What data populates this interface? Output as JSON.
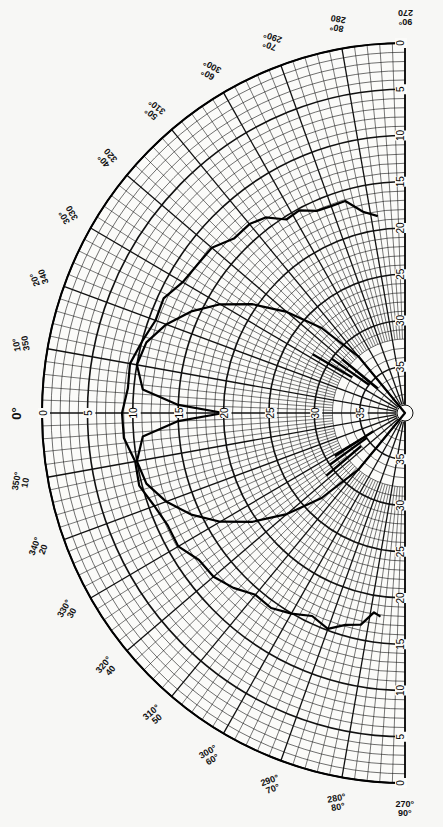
{
  "chart_data": {
    "type": "polar-line",
    "title": "",
    "center_px": [
      405,
      413
    ],
    "radius_px": 368,
    "radial_axis": {
      "label": "dB down",
      "min": 0,
      "max": 40,
      "outer_value": 0,
      "center_value": 40,
      "ticks": [
        0,
        5,
        10,
        15,
        20,
        25,
        30,
        35
      ],
      "tick_labels_upper": [
        "0",
        "5",
        "10",
        "15",
        "20",
        "25",
        "30",
        "35"
      ],
      "tick_labels_lower": [
        "0",
        "5",
        "10",
        "15",
        "20",
        "25",
        "30",
        "35"
      ],
      "tick_labels_axis0": [
        "0",
        "5",
        "10",
        "15",
        "20",
        "25",
        "30",
        "35"
      ]
    },
    "angular_axis": {
      "direction_0deg": "left",
      "span": "180° half-circle",
      "labels_upper": [
        {
          "deg": 0,
          "text": [
            "0°"
          ]
        },
        {
          "deg": 10,
          "text": [
            "10°",
            "350"
          ]
        },
        {
          "deg": 20,
          "text": [
            "20°",
            "340"
          ]
        },
        {
          "deg": 30,
          "text": [
            "30°",
            "330"
          ]
        },
        {
          "deg": 40,
          "text": [
            "40°",
            "320"
          ]
        },
        {
          "deg": 50,
          "text": [
            "50°",
            "310°"
          ]
        },
        {
          "deg": 60,
          "text": [
            "60°",
            "300°"
          ]
        },
        {
          "deg": 70,
          "text": [
            "70°",
            "290°"
          ]
        },
        {
          "deg": 80,
          "text": [
            "80°",
            "280"
          ]
        },
        {
          "deg": 90,
          "text": [
            "90°",
            "270"
          ]
        }
      ],
      "labels_lower": [
        {
          "deg": -10,
          "text": [
            "350°",
            "10"
          ]
        },
        {
          "deg": -20,
          "text": [
            "340°",
            "20"
          ]
        },
        {
          "deg": -30,
          "text": [
            "330°",
            "30"
          ]
        },
        {
          "deg": -40,
          "text": [
            "320°",
            "40"
          ]
        },
        {
          "deg": -50,
          "text": [
            "310°",
            "50"
          ]
        },
        {
          "deg": -60,
          "text": [
            "300°",
            "60°"
          ]
        },
        {
          "deg": -70,
          "text": [
            "290°",
            "70°"
          ]
        },
        {
          "deg": -80,
          "text": [
            "280°",
            "80°"
          ]
        },
        {
          "deg": -90,
          "text": [
            "270°",
            "90°"
          ]
        }
      ]
    },
    "series": [
      {
        "name": "wide-pattern",
        "units": "dB down vs angle (deg)",
        "points": [
          {
            "angle": 82,
            "db": 18.5
          },
          {
            "angle": 78,
            "db": 17.5
          },
          {
            "angle": 74,
            "db": 16.5
          },
          {
            "angle": 70,
            "db": 16
          },
          {
            "angle": 66,
            "db": 16
          },
          {
            "angle": 62,
            "db": 15.5
          },
          {
            "angle": 58,
            "db": 15
          },
          {
            "angle": 54,
            "db": 14
          },
          {
            "angle": 50,
            "db": 13.5
          },
          {
            "angle": 45,
            "db": 13
          },
          {
            "angle": 40,
            "db": 12.5
          },
          {
            "angle": 35,
            "db": 12
          },
          {
            "angle": 30,
            "db": 11.5
          },
          {
            "angle": 25,
            "db": 11
          },
          {
            "angle": 20,
            "db": 10.5
          },
          {
            "angle": 15,
            "db": 10
          },
          {
            "angle": 10,
            "db": 9.5
          },
          {
            "angle": 5,
            "db": 9
          },
          {
            "angle": 0,
            "db": 9
          },
          {
            "angle": -5,
            "db": 9
          },
          {
            "angle": -10,
            "db": 9.5
          },
          {
            "angle": -15,
            "db": 10
          },
          {
            "angle": -20,
            "db": 10.5
          },
          {
            "angle": -25,
            "db": 11
          },
          {
            "angle": -30,
            "db": 11.5
          },
          {
            "angle": -35,
            "db": 12
          },
          {
            "angle": -40,
            "db": 12.5
          },
          {
            "angle": -45,
            "db": 13.5
          },
          {
            "angle": -50,
            "db": 14
          },
          {
            "angle": -55,
            "db": 14.5
          },
          {
            "angle": -60,
            "db": 15
          },
          {
            "angle": -65,
            "db": 15.5
          },
          {
            "angle": -70,
            "db": 15.5
          },
          {
            "angle": -74,
            "db": 16
          },
          {
            "angle": -78,
            "db": 16.5
          },
          {
            "angle": -81,
            "db": 18.5
          },
          {
            "angle": -83,
            "db": 17.5
          }
        ]
      },
      {
        "name": "narrow-pattern",
        "units": "dB down vs angle (deg)",
        "points": [
          {
            "angle": 0,
            "db": 20
          },
          {
            "angle": 2,
            "db": 15
          },
          {
            "angle": 5,
            "db": 11
          },
          {
            "angle": 10,
            "db": 10
          },
          {
            "angle": 15,
            "db": 10.5
          },
          {
            "angle": 20,
            "db": 12
          },
          {
            "angle": 25,
            "db": 14
          },
          {
            "angle": 30,
            "db": 16.5
          },
          {
            "angle": 35,
            "db": 19.5
          },
          {
            "angle": 40,
            "db": 23
          },
          {
            "angle": 45,
            "db": 27
          },
          {
            "angle": 50,
            "db": 32
          },
          {
            "angle": 55,
            "db": 40
          },
          {
            "angle": -55,
            "db": 40
          },
          {
            "angle": -50,
            "db": 32
          },
          {
            "angle": -45,
            "db": 27
          },
          {
            "angle": -40,
            "db": 23
          },
          {
            "angle": -35,
            "db": 19.5
          },
          {
            "angle": -30,
            "db": 16.5
          },
          {
            "angle": -25,
            "db": 14
          },
          {
            "angle": -20,
            "db": 12
          },
          {
            "angle": -15,
            "db": 10.5
          },
          {
            "angle": -10,
            "db": 10
          },
          {
            "angle": -5,
            "db": 11
          },
          {
            "angle": -2,
            "db": 15
          },
          {
            "angle": 0,
            "db": 20
          }
        ]
      }
    ],
    "grid": true,
    "legend": null
  }
}
